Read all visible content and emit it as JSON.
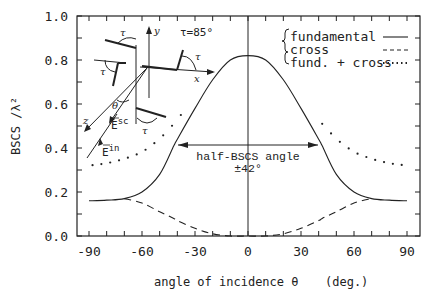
{
  "chart_data": {
    "type": "line",
    "title": "",
    "xlabel": "angle of incidence θ   (deg.)",
    "ylabel": "BSCS / λ²",
    "xlim": [
      -90,
      90
    ],
    "ylim": [
      0.0,
      1.0
    ],
    "x_ticks": [
      -90,
      -60,
      -30,
      0,
      30,
      60,
      90
    ],
    "y_ticks": [
      0.0,
      0.2,
      0.4,
      0.6,
      0.8,
      1.0
    ],
    "x_tick_labels": [
      "-90",
      "-60",
      "-30",
      "0",
      "30",
      "60",
      "90"
    ],
    "y_tick_labels": [
      "0.0",
      "0.2",
      "0.4",
      "0.6",
      "0.8",
      "1.0"
    ],
    "grid": false,
    "legend_position": "upper right",
    "x": [
      -90,
      -80,
      -70,
      -60,
      -50,
      -42,
      -40,
      -30,
      -20,
      -10,
      0,
      10,
      20,
      30,
      40,
      42,
      50,
      60,
      70,
      80,
      90
    ],
    "series": [
      {
        "name": "fundamental",
        "style": "solid",
        "values": [
          0.16,
          0.163,
          0.17,
          0.2,
          0.28,
          0.41,
          0.44,
          0.58,
          0.71,
          0.8,
          0.82,
          0.8,
          0.71,
          0.58,
          0.44,
          0.41,
          0.28,
          0.2,
          0.17,
          0.163,
          0.16
        ]
      },
      {
        "name": "cross",
        "style": "dashed",
        "values": [
          0.16,
          0.167,
          0.17,
          0.15,
          0.11,
          0.08,
          0.07,
          0.035,
          0.01,
          0.0,
          0.0,
          0.0,
          0.01,
          0.035,
          0.07,
          0.08,
          0.11,
          0.15,
          0.17,
          0.167,
          0.16
        ]
      },
      {
        "name": "fund. + cross",
        "style": "dotted",
        "values": [
          0.32,
          0.33,
          0.35,
          0.38,
          0.44,
          0.51,
          0.53,
          0.63,
          0.72,
          0.79,
          0.82,
          0.79,
          0.72,
          0.63,
          0.53,
          0.51,
          0.44,
          0.38,
          0.35,
          0.33,
          0.32
        ]
      }
    ],
    "annotations": [
      {
        "text": "half-BSCS angle",
        "x": 0,
        "y": 0.41
      },
      {
        "text": "±42°",
        "x": 0,
        "y": 0.36
      },
      {
        "text": "τ=85°",
        "type": "inset-diagram-label"
      }
    ]
  },
  "legend": {
    "items": [
      "fundamental",
      "cross",
      "fund. + cross"
    ]
  },
  "axes": {
    "xlabel_main": "angle of incidence θ",
    "xlabel_unit": "(deg.)",
    "ylabel": "BSCS /λ²"
  },
  "annotation": {
    "half_label": "half-BSCS angle",
    "half_value": "±42°"
  },
  "inset": {
    "tau_value": "τ=85°",
    "tau": "τ",
    "axis_x": "x",
    "axis_y": "y",
    "axis_z": "z",
    "theta": "θ",
    "e_sc": "E",
    "e_sc_sup": "sc",
    "e_in": "E",
    "e_in_sup": "in"
  }
}
